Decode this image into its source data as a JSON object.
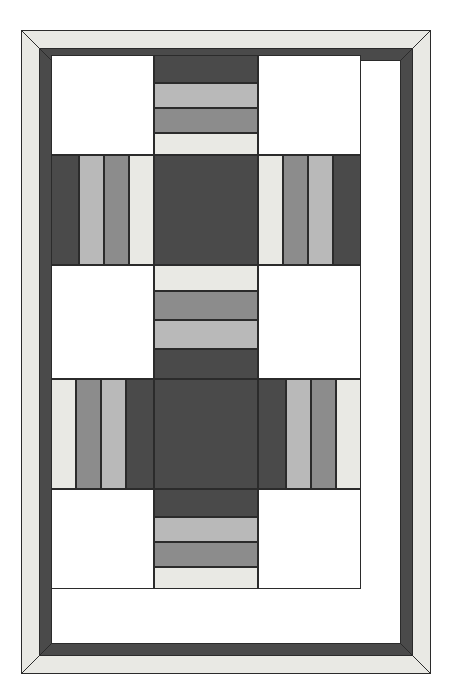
{
  "figure": {
    "kind": "quilt-block-diagram",
    "canvas": {
      "width": 453,
      "height": 700,
      "background": "#ffffff"
    },
    "title_text": "",
    "caption_text": ""
  },
  "palette": {
    "outline": "#2b2b2b",
    "background_white": "#ffffff",
    "patch_white": "#ffffff",
    "patch_cream": "#e9e9e4",
    "patch_light_gray": "#b9b9b9",
    "patch_medium_gray": "#8c8c8c",
    "patch_dark_gray": "#4a4a4a",
    "border_outer_cream": "#e9e9e4",
    "border_inner_dark": "#4a4a4a",
    "miter_line": "#2b2b2b"
  },
  "border": {
    "outer_band_label": "outer cream border",
    "outer_band_color": "#e9e9e4",
    "outer_band_width_px": 18,
    "inner_band_label": "inner dark border",
    "inner_band_color": "#4a4a4a",
    "inner_band_width_px": 12,
    "mitered": "true",
    "outer_rect": {
      "x": 0,
      "y": 0,
      "width": 410,
      "height": 644
    }
  },
  "layout": {
    "rows": 5,
    "cols": 3,
    "col_widths_px": [
      103,
      104,
      103
    ],
    "row_heights_px": [
      100,
      110,
      114,
      110,
      100
    ],
    "field_rect": {
      "x": 51,
      "y": 55,
      "width": 310,
      "height": 534
    }
  },
  "chart_data": {
    "type": "heatmap",
    "xlabel": "",
    "ylabel": "",
    "legend_position": "none",
    "grid": "on",
    "categories": [
      "left",
      "center",
      "right"
    ],
    "x": [
      "row-1",
      "row-2",
      "row-3",
      "row-4",
      "row-5"
    ],
    "color_levels": {
      "white": "#ffffff",
      "cream": "#e9e9e4",
      "light": "#b9b9b9",
      "medium": "#8c8c8c",
      "dark": "#4a4a4a"
    },
    "blocks": [
      {
        "id": "r1c1",
        "name": "top-left-plain-square",
        "row": 1,
        "col": 1,
        "rect": {
          "x": 0,
          "y": 0,
          "width": 103,
          "height": 100
        },
        "pieces": [
          {
            "color": "#ffffff",
            "level": "white",
            "span": 1
          }
        ],
        "orientation": "none"
      },
      {
        "id": "r1c2",
        "name": "top-center-strip-set",
        "row": 1,
        "col": 2,
        "rect": {
          "x": 103,
          "y": 0,
          "width": 104,
          "height": 100
        },
        "orientation": "horizontal",
        "pieces": [
          {
            "color": "#4a4a4a",
            "level": "dark",
            "height": 28
          },
          {
            "color": "#b9b9b9",
            "level": "light",
            "height": 25
          },
          {
            "color": "#8c8c8c",
            "level": "medium",
            "height": 25
          },
          {
            "color": "#e9e9e4",
            "level": "cream",
            "height": 22
          }
        ]
      },
      {
        "id": "r1c3",
        "name": "top-right-plain-square",
        "row": 1,
        "col": 3,
        "rect": {
          "x": 207,
          "y": 0,
          "width": 103,
          "height": 100
        },
        "pieces": [
          {
            "color": "#ffffff",
            "level": "white",
            "span": 1
          }
        ],
        "orientation": "none"
      },
      {
        "id": "r2c1",
        "name": "upper-left-strip-set",
        "row": 2,
        "col": 1,
        "rect": {
          "x": 0,
          "y": 100,
          "width": 103,
          "height": 110
        },
        "orientation": "vertical",
        "pieces": [
          {
            "color": "#4a4a4a",
            "level": "dark",
            "width": 28
          },
          {
            "color": "#b9b9b9",
            "level": "light",
            "width": 25
          },
          {
            "color": "#8c8c8c",
            "level": "medium",
            "width": 25
          },
          {
            "color": "#e9e9e4",
            "level": "cream",
            "width": 25
          }
        ]
      },
      {
        "id": "r2c2",
        "name": "upper-center-dark-square",
        "row": 2,
        "col": 2,
        "rect": {
          "x": 103,
          "y": 100,
          "width": 104,
          "height": 110
        },
        "orientation": "none",
        "pieces": [
          {
            "color": "#4a4a4a",
            "level": "dark",
            "span": 1
          }
        ]
      },
      {
        "id": "r2c3",
        "name": "upper-right-strip-set",
        "row": 2,
        "col": 3,
        "rect": {
          "x": 207,
          "y": 100,
          "width": 103,
          "height": 110
        },
        "orientation": "vertical",
        "pieces": [
          {
            "color": "#e9e9e4",
            "level": "cream",
            "width": 25
          },
          {
            "color": "#8c8c8c",
            "level": "medium",
            "width": 25
          },
          {
            "color": "#b9b9b9",
            "level": "light",
            "width": 25
          },
          {
            "color": "#4a4a4a",
            "level": "dark",
            "width": 28
          }
        ]
      },
      {
        "id": "r3c1",
        "name": "middle-left-plain-square",
        "row": 3,
        "col": 1,
        "rect": {
          "x": 0,
          "y": 210,
          "width": 103,
          "height": 114
        },
        "orientation": "none",
        "pieces": [
          {
            "color": "#ffffff",
            "level": "white",
            "span": 1
          }
        ]
      },
      {
        "id": "r3c2",
        "name": "middle-center-strip-set",
        "row": 3,
        "col": 2,
        "rect": {
          "x": 103,
          "y": 210,
          "width": 104,
          "height": 114
        },
        "orientation": "horizontal",
        "pieces": [
          {
            "color": "#e9e9e4",
            "level": "cream",
            "height": 26
          },
          {
            "color": "#8c8c8c",
            "level": "medium",
            "height": 29
          },
          {
            "color": "#b9b9b9",
            "level": "light",
            "height": 29
          },
          {
            "color": "#4a4a4a",
            "level": "dark",
            "height": 30
          }
        ]
      },
      {
        "id": "r3c3",
        "name": "middle-right-plain-square",
        "row": 3,
        "col": 3,
        "rect": {
          "x": 207,
          "y": 210,
          "width": 103,
          "height": 114
        },
        "orientation": "none",
        "pieces": [
          {
            "color": "#ffffff",
            "level": "white",
            "span": 1
          }
        ]
      },
      {
        "id": "r4c1",
        "name": "lower-left-strip-set",
        "row": 4,
        "col": 1,
        "rect": {
          "x": 0,
          "y": 324,
          "width": 103,
          "height": 110
        },
        "orientation": "vertical",
        "pieces": [
          {
            "color": "#e9e9e4",
            "level": "cream",
            "width": 25
          },
          {
            "color": "#8c8c8c",
            "level": "medium",
            "width": 25
          },
          {
            "color": "#b9b9b9",
            "level": "light",
            "width": 25
          },
          {
            "color": "#4a4a4a",
            "level": "dark",
            "width": 28
          }
        ]
      },
      {
        "id": "r4c2",
        "name": "lower-center-dark-square",
        "row": 4,
        "col": 2,
        "rect": {
          "x": 103,
          "y": 324,
          "width": 104,
          "height": 110
        },
        "orientation": "none",
        "pieces": [
          {
            "color": "#4a4a4a",
            "level": "dark",
            "span": 1
          }
        ]
      },
      {
        "id": "r4c3",
        "name": "lower-right-strip-set",
        "row": 4,
        "col": 3,
        "rect": {
          "x": 207,
          "y": 324,
          "width": 103,
          "height": 110
        },
        "orientation": "vertical",
        "pieces": [
          {
            "color": "#4a4a4a",
            "level": "dark",
            "width": 28
          },
          {
            "color": "#b9b9b9",
            "level": "light",
            "width": 25
          },
          {
            "color": "#8c8c8c",
            "level": "medium",
            "width": 25
          },
          {
            "color": "#e9e9e4",
            "level": "cream",
            "width": 25
          }
        ]
      },
      {
        "id": "r5c1",
        "name": "bottom-left-plain-square",
        "row": 5,
        "col": 1,
        "rect": {
          "x": 0,
          "y": 434,
          "width": 103,
          "height": 100
        },
        "orientation": "none",
        "pieces": [
          {
            "color": "#ffffff",
            "level": "white",
            "span": 1
          }
        ]
      },
      {
        "id": "r5c2",
        "name": "bottom-center-strip-set",
        "row": 5,
        "col": 2,
        "rect": {
          "x": 103,
          "y": 434,
          "width": 104,
          "height": 100
        },
        "orientation": "horizontal",
        "pieces": [
          {
            "color": "#4a4a4a",
            "level": "dark",
            "height": 28
          },
          {
            "color": "#b9b9b9",
            "level": "light",
            "height": 25
          },
          {
            "color": "#8c8c8c",
            "level": "medium",
            "height": 25
          },
          {
            "color": "#e9e9e4",
            "level": "cream",
            "height": 22
          }
        ]
      },
      {
        "id": "r5c3",
        "name": "bottom-right-plain-square",
        "row": 5,
        "col": 3,
        "rect": {
          "x": 207,
          "y": 434,
          "width": 103,
          "height": 100
        },
        "orientation": "none",
        "pieces": [
          {
            "color": "#ffffff",
            "level": "white",
            "span": 1
          }
        ]
      }
    ]
  }
}
